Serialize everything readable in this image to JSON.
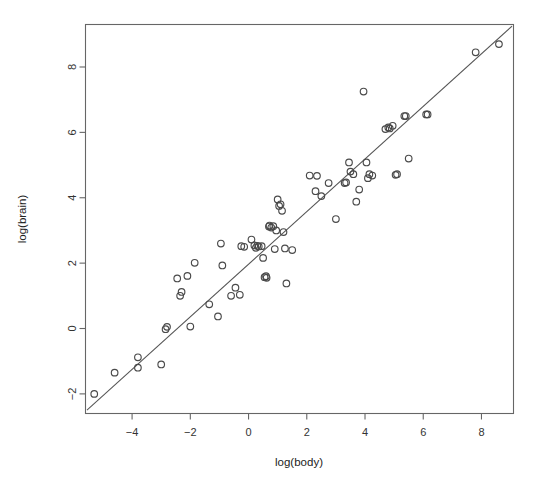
{
  "chart_data": {
    "type": "scatter",
    "title": "",
    "xlabel": "log(body)",
    "ylabel": "log(brain)",
    "xlim": [
      -5.6,
      9.1
    ],
    "ylim": [
      -2.6,
      9.3
    ],
    "xticks": [
      -4,
      -2,
      0,
      2,
      4,
      6,
      8
    ],
    "yticks": [
      -2,
      0,
      2,
      4,
      6,
      8
    ],
    "grid": false,
    "legend": null,
    "series": [
      {
        "name": "mammals",
        "marker": "open-circle",
        "marker_color": "#4a4a4a",
        "points": [
          [
            -5.3,
            -2.0
          ],
          [
            -4.6,
            -1.35
          ],
          [
            -3.8,
            -0.88
          ],
          [
            -3.8,
            -1.2
          ],
          [
            -3.0,
            -1.1
          ],
          [
            -2.85,
            -0.02
          ],
          [
            -2.8,
            0.05
          ],
          [
            -2.45,
            1.53
          ],
          [
            -2.3,
            1.12
          ],
          [
            -2.35,
            1.0
          ],
          [
            -2.1,
            1.61
          ],
          [
            -2.0,
            0.06
          ],
          [
            -1.85,
            2.01
          ],
          [
            -1.35,
            0.74
          ],
          [
            -1.05,
            0.37
          ],
          [
            -0.95,
            2.6
          ],
          [
            -0.9,
            1.93
          ],
          [
            -0.6,
            1.0
          ],
          [
            -0.45,
            1.25
          ],
          [
            -0.3,
            1.03
          ],
          [
            -0.25,
            2.52
          ],
          [
            -0.15,
            2.5
          ],
          [
            0.1,
            2.72
          ],
          [
            0.2,
            2.54
          ],
          [
            0.25,
            2.47
          ],
          [
            0.3,
            2.53
          ],
          [
            0.35,
            2.51
          ],
          [
            0.45,
            2.52
          ],
          [
            0.5,
            2.16
          ],
          [
            0.55,
            1.57
          ],
          [
            0.6,
            1.6
          ],
          [
            0.62,
            1.55
          ],
          [
            0.7,
            3.12
          ],
          [
            0.72,
            3.15
          ],
          [
            0.78,
            3.09
          ],
          [
            0.85,
            3.13
          ],
          [
            0.9,
            2.43
          ],
          [
            0.95,
            3.0
          ],
          [
            1.0,
            3.95
          ],
          [
            1.05,
            3.75
          ],
          [
            1.1,
            3.8
          ],
          [
            1.15,
            3.6
          ],
          [
            1.2,
            2.95
          ],
          [
            1.25,
            2.45
          ],
          [
            1.3,
            1.38
          ],
          [
            1.5,
            2.4
          ],
          [
            2.1,
            4.68
          ],
          [
            2.35,
            4.67
          ],
          [
            2.3,
            4.2
          ],
          [
            2.5,
            4.05
          ],
          [
            2.75,
            4.45
          ],
          [
            3.0,
            3.35
          ],
          [
            3.3,
            4.45
          ],
          [
            3.35,
            4.47
          ],
          [
            3.45,
            5.08
          ],
          [
            3.5,
            4.8
          ],
          [
            3.6,
            4.72
          ],
          [
            3.7,
            3.88
          ],
          [
            3.8,
            4.25
          ],
          [
            3.95,
            7.25
          ],
          [
            4.05,
            5.08
          ],
          [
            4.1,
            4.6
          ],
          [
            4.15,
            4.72
          ],
          [
            4.25,
            4.68
          ],
          [
            4.7,
            6.1
          ],
          [
            4.8,
            6.15
          ],
          [
            4.85,
            6.12
          ],
          [
            4.95,
            6.2
          ],
          [
            5.05,
            4.7
          ],
          [
            5.1,
            4.72
          ],
          [
            5.35,
            6.5
          ],
          [
            5.4,
            6.5
          ],
          [
            5.5,
            5.2
          ],
          [
            6.1,
            6.55
          ],
          [
            6.15,
            6.55
          ],
          [
            7.8,
            8.45
          ],
          [
            8.6,
            8.7
          ]
        ]
      }
    ],
    "fit_line": {
      "name": "reference-line",
      "color": "#555555",
      "x0": -5.55,
      "y0": -2.5,
      "x1": 9.05,
      "y1": 9.25
    }
  }
}
